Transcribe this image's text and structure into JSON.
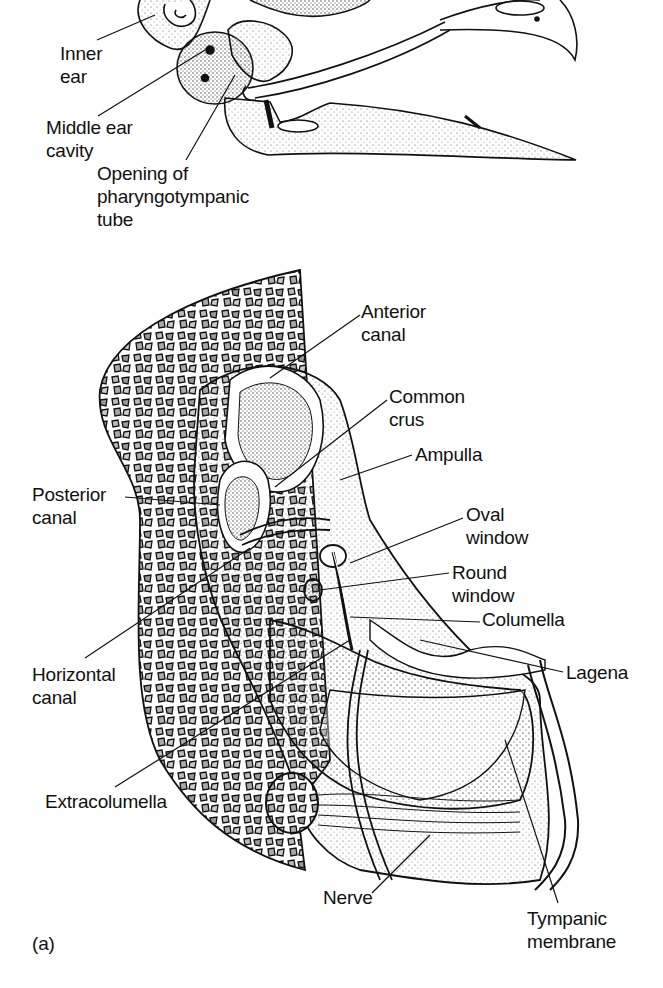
{
  "figure": {
    "panel_label": "(a)",
    "upper_view": {
      "labels": [
        {
          "id": "inner-ear",
          "text": "Inner\near",
          "x": 60,
          "y": 42
        },
        {
          "id": "middle-ear-cavity",
          "text": "Middle ear\ncavity",
          "x": 46,
          "y": 116
        },
        {
          "id": "pharyngotympanic-opening",
          "text": "Opening of\npharyngotympanic\ntube",
          "x": 97,
          "y": 162
        }
      ]
    },
    "lower_view": {
      "labels": [
        {
          "id": "anterior-canal",
          "text": "Anterior\ncanal",
          "x": 361,
          "y": 300
        },
        {
          "id": "common-crus",
          "text": "Common\ncrus",
          "x": 389,
          "y": 385
        },
        {
          "id": "ampulla",
          "text": "Ampulla",
          "x": 415,
          "y": 443
        },
        {
          "id": "posterior-canal",
          "text": "Posterior\ncanal",
          "x": 32,
          "y": 483
        },
        {
          "id": "oval-window",
          "text": "Oval\nwindow",
          "x": 466,
          "y": 503
        },
        {
          "id": "round-window",
          "text": "Round\nwindow",
          "x": 452,
          "y": 561
        },
        {
          "id": "columella",
          "text": "Columella",
          "x": 482,
          "y": 608
        },
        {
          "id": "lagena",
          "text": "Lagena",
          "x": 566,
          "y": 661
        },
        {
          "id": "horizontal-canal",
          "text": "Horizontal\ncanal",
          "x": 32,
          "y": 663
        },
        {
          "id": "extracolumella",
          "text": "Extracolumella",
          "x": 45,
          "y": 790
        },
        {
          "id": "nerve",
          "text": "Nerve",
          "x": 323,
          "y": 886
        },
        {
          "id": "tympanic-membrane",
          "text": "Tympanic\nmembrane",
          "x": 527,
          "y": 907
        }
      ]
    }
  }
}
